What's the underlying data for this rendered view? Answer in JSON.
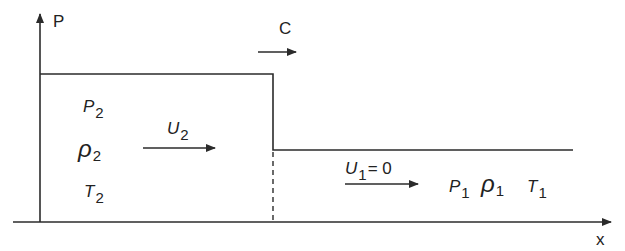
{
  "diagram": {
    "type": "shock wave pressure step profile",
    "axes": {
      "y_label": "P",
      "x_label": "x"
    },
    "wave_speed": {
      "label": "C",
      "direction": "right"
    },
    "region_2": {
      "pressure": {
        "sym": "P",
        "sub": "2"
      },
      "density": {
        "sym": "ρ",
        "sub": "2"
      },
      "temperature": {
        "sym": "T",
        "sub": "2"
      },
      "velocity": {
        "sym": "U",
        "sub": "2"
      }
    },
    "region_1": {
      "velocity": {
        "sym": "U",
        "sub": "1",
        "value": "= 0"
      },
      "pressure": {
        "sym": "P",
        "sub": "1"
      },
      "density": {
        "sym": "ρ",
        "sub": "1"
      },
      "temperature": {
        "sym": "T",
        "sub": "1"
      }
    },
    "colors": {
      "line": "#2b2b2b",
      "background": "#ffffff"
    }
  }
}
